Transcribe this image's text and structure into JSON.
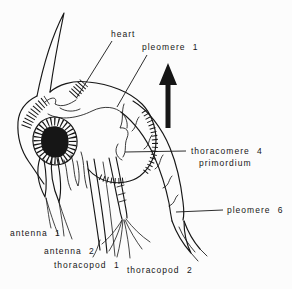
{
  "colors": {
    "ink": "#161616",
    "paper": "#fcfcfc"
  },
  "icons": {
    "orientation_arrow": "up-arrow"
  },
  "labels": {
    "heart": "heart",
    "pleomere_1": "pleomere 1",
    "thoracomere_4": "thoracomere 4",
    "primordium": "primordium",
    "pleomere_6": "pleomere 6",
    "antenna_1": "antenna 1",
    "antenna_2": "antenna 2",
    "thoracopod_1": "thoracopod 1",
    "thoracopod_2": "thoracopod 2"
  }
}
